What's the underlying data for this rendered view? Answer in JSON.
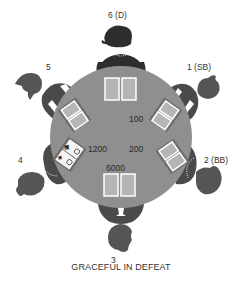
{
  "colors": {
    "table": "#8f8f8f",
    "player_body": "#4a4a4a",
    "player_head": "#555555",
    "dealer_body": "#2e2e2e",
    "card_back": "#b5b5b5",
    "card_border": "#ffffff",
    "text": "#333333",
    "background": "#ffffff"
  },
  "seats": [
    {
      "seat": "1",
      "label": "1 (SB)",
      "role": "small blind"
    },
    {
      "seat": "2",
      "label": "2 (BB)",
      "role": "big blind"
    },
    {
      "seat": "3",
      "label": "3",
      "role": ""
    },
    {
      "seat": "4",
      "label": "4",
      "role": "",
      "cards_face_up": [
        "♣",
        "♠"
      ]
    },
    {
      "seat": "5",
      "label": "5",
      "role": ""
    },
    {
      "seat": "6",
      "label": "6 (D)",
      "role": "dealer"
    }
  ],
  "bets": [
    {
      "seat": "1",
      "amount": "100"
    },
    {
      "seat": "2",
      "amount": "200"
    },
    {
      "seat": "3",
      "amount": "6000"
    },
    {
      "seat": "4",
      "amount": "1200"
    }
  ],
  "caption": "GRACEFUL IN DEFEAT",
  "card_suits": {
    "club": "♣",
    "spade": "♠"
  }
}
